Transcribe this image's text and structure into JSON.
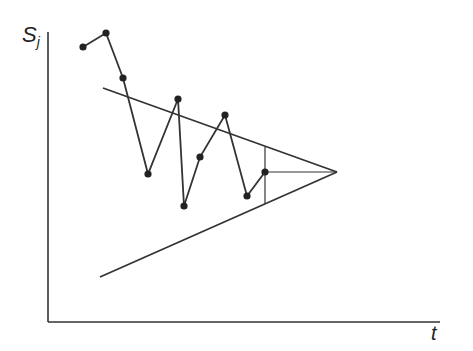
{
  "chart_data": {
    "type": "line",
    "title": "",
    "xlabel": "t",
    "ylabel": "S",
    "ylabel_sub": "j",
    "series": [
      {
        "name": "S_j",
        "points": [
          [
            83,
            47
          ],
          [
            106,
            33
          ],
          [
            123,
            78
          ],
          [
            148,
            174
          ],
          [
            178,
            99
          ],
          [
            184,
            206
          ],
          [
            200,
            157
          ],
          [
            225,
            115
          ],
          [
            247,
            196
          ],
          [
            265,
            172
          ]
        ]
      }
    ],
    "annotations": {
      "upper_trend": [
        [
          103,
          88
        ],
        [
          337,
          172
        ]
      ],
      "lower_trend": [
        [
          100,
          277
        ],
        [
          337,
          172
        ]
      ],
      "vertical_marker": [
        [
          265,
          147
        ],
        [
          265,
          204
        ]
      ],
      "horizontal_marker": [
        [
          265,
          172
        ],
        [
          337,
          172
        ]
      ]
    },
    "grid": false,
    "legend": null
  }
}
